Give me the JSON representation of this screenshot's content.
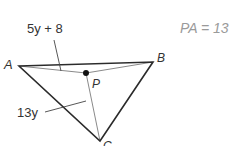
{
  "diagram": {
    "type": "triangle-geometry",
    "given": "PA = 13",
    "given_parts": {
      "lhs": "PA",
      "op": "=",
      "rhs": "13"
    },
    "vertices": [
      {
        "name": "A",
        "x": 19,
        "y": 66
      },
      {
        "name": "B",
        "x": 153,
        "y": 62
      },
      {
        "name": "C",
        "x": 100,
        "y": 141
      }
    ],
    "interior_point": {
      "name": "P",
      "x": 86,
      "y": 73
    },
    "segment_labels": [
      {
        "segment": "PA",
        "text": "5y + 8"
      },
      {
        "segment": "PC",
        "text": "13y"
      }
    ],
    "colors": {
      "triangle_edge": "#2b2b2b",
      "inner_segment": "#8a8a8a",
      "point": "#111111",
      "label": "#333333",
      "given_text": "#9a9a9a"
    }
  }
}
